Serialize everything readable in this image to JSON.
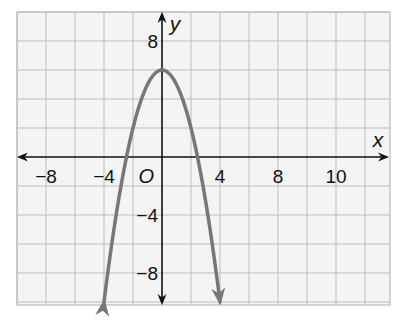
{
  "chart_data": {
    "type": "line",
    "title": "",
    "xlabel": "x",
    "ylabel": "y",
    "origin_label": "O",
    "xlim": [
      -10,
      16
    ],
    "ylim": [
      -10.4,
      10
    ],
    "grid": true,
    "grid_step": 2,
    "x_ticks": [
      {
        "value": -8,
        "label": "−8"
      },
      {
        "value": -4,
        "label": "−4"
      },
      {
        "value": 4,
        "label": "4"
      },
      {
        "value": 8,
        "label": "8"
      },
      {
        "value": 12,
        "label": "10"
      }
    ],
    "y_ticks": [
      {
        "value": 8,
        "label": "8"
      },
      {
        "value": -4,
        "label": "−4"
      },
      {
        "value": -8,
        "label": "−8"
      }
    ],
    "series": [
      {
        "name": "y = -x^2 + 6",
        "equation": "y = -x^2 + 6",
        "vertex": [
          0,
          6
        ],
        "x_intercepts": [
          -2.45,
          2.45
        ],
        "x_range": [
          -4,
          4
        ],
        "arrows_at_ends": true,
        "color": "#777777"
      }
    ]
  }
}
